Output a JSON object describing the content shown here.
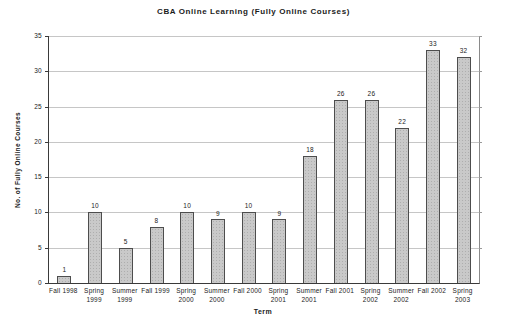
{
  "chart_data": {
    "type": "bar",
    "title": "CBA Online Learning (Fully Online Courses)",
    "xlabel": "Term",
    "ylabel": "No. of Fully Online Courses",
    "categories": [
      "Fall 1998",
      "Spring 1999",
      "Summer 1999",
      "Fall 1999",
      "Spring 2000",
      "Summer 2000",
      "Fall 2000",
      "Spring 2001",
      "Summer 2001",
      "Fall 2001",
      "Spring 2002",
      "Summer 2002",
      "Fall 2002",
      "Spring 2003"
    ],
    "category_label_lines": [
      [
        "Fall 1998"
      ],
      [
        "Spring",
        "1999"
      ],
      [
        "Summer",
        "1999"
      ],
      [
        "Fall 1999"
      ],
      [
        "Spring",
        "2000"
      ],
      [
        "Summer",
        "2000"
      ],
      [
        "Fall 2000"
      ],
      [
        "Spring",
        "2001"
      ],
      [
        "Summer",
        "2001"
      ],
      [
        "Fall 2001"
      ],
      [
        "Spring",
        "2002"
      ],
      [
        "Summer",
        "2002"
      ],
      [
        "Fall 2002"
      ],
      [
        "Spring",
        "2003"
      ]
    ],
    "values": [
      1,
      10,
      5,
      8,
      10,
      9,
      10,
      9,
      18,
      26,
      26,
      22,
      33,
      32
    ],
    "data_labels_shown": true,
    "ylim": [
      0,
      35
    ],
    "yticks": [
      0,
      5,
      10,
      15,
      20,
      25,
      30,
      35
    ],
    "grid": true,
    "legend": false,
    "colors": {
      "bar_fill": "#c9c9c9",
      "bar_border": "#4d4d4d",
      "gridline": "#c6c6c6",
      "axis": "#3a3a3a",
      "text": "#1b1b1b",
      "background": "#ffffff"
    }
  }
}
